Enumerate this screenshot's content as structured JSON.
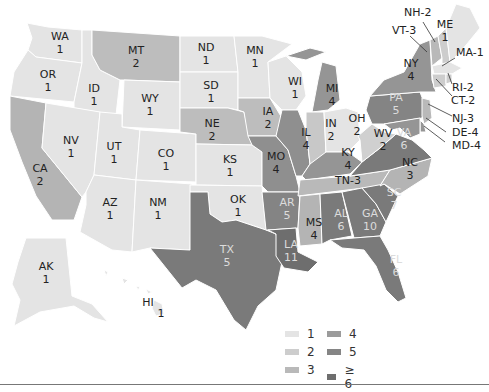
{
  "legend": {
    "items": [
      {
        "label": "1",
        "color": "#e4e4e4"
      },
      {
        "label": "2",
        "color": "#cdcdcd"
      },
      {
        "label": "3",
        "color": "#b9b9b9"
      },
      {
        "label": "4",
        "color": "#9b9b9b"
      },
      {
        "label": "5",
        "color": "#858585"
      },
      {
        "label": "≥ 6",
        "color": "#6e6e6e"
      }
    ]
  },
  "states": [
    {
      "abbr": "WA",
      "value": "1"
    },
    {
      "abbr": "OR",
      "value": "1"
    },
    {
      "abbr": "CA",
      "value": "2"
    },
    {
      "abbr": "ID",
      "value": "1"
    },
    {
      "abbr": "NV",
      "value": "1"
    },
    {
      "abbr": "MT",
      "value": "2"
    },
    {
      "abbr": "WY",
      "value": "1"
    },
    {
      "abbr": "UT",
      "value": "1"
    },
    {
      "abbr": "AZ",
      "value": "1"
    },
    {
      "abbr": "CO",
      "value": "1"
    },
    {
      "abbr": "NM",
      "value": "1"
    },
    {
      "abbr": "ND",
      "value": "1"
    },
    {
      "abbr": "SD",
      "value": "1"
    },
    {
      "abbr": "NE",
      "value": "2"
    },
    {
      "abbr": "KS",
      "value": "1"
    },
    {
      "abbr": "OK",
      "value": "1"
    },
    {
      "abbr": "TX",
      "value": "5"
    },
    {
      "abbr": "MN",
      "value": "1"
    },
    {
      "abbr": "IA",
      "value": "2"
    },
    {
      "abbr": "MO",
      "value": "4"
    },
    {
      "abbr": "AR",
      "value": "5"
    },
    {
      "abbr": "LA",
      "value": "11"
    },
    {
      "abbr": "WI",
      "value": "1"
    },
    {
      "abbr": "IL",
      "value": "4"
    },
    {
      "abbr": "MI",
      "value": "4"
    },
    {
      "abbr": "IN",
      "value": "2"
    },
    {
      "abbr": "OH",
      "value": "2"
    },
    {
      "abbr": "KY",
      "value": "4"
    },
    {
      "abbr": "TN",
      "value": "3"
    },
    {
      "abbr": "MS",
      "value": "4"
    },
    {
      "abbr": "AL",
      "value": "6"
    },
    {
      "abbr": "GA",
      "value": "10"
    },
    {
      "abbr": "FL",
      "value": "6"
    },
    {
      "abbr": "SC",
      "value": "7"
    },
    {
      "abbr": "NC",
      "value": "3"
    },
    {
      "abbr": "VA",
      "value": "6"
    },
    {
      "abbr": "WV",
      "value": "2"
    },
    {
      "abbr": "PA",
      "value": "5"
    },
    {
      "abbr": "NY",
      "value": "4"
    },
    {
      "abbr": "VT",
      "value": "3"
    },
    {
      "abbr": "NH",
      "value": "2"
    },
    {
      "abbr": "ME",
      "value": "1"
    },
    {
      "abbr": "MA",
      "value": "1"
    },
    {
      "abbr": "RI",
      "value": "2"
    },
    {
      "abbr": "CT",
      "value": "2"
    },
    {
      "abbr": "NJ",
      "value": "3"
    },
    {
      "abbr": "DE",
      "value": "4"
    },
    {
      "abbr": "MD",
      "value": "4"
    },
    {
      "abbr": "AK",
      "value": "1"
    },
    {
      "abbr": "HI",
      "value": "1"
    }
  ],
  "labels": {
    "WA": "WA\n1",
    "OR": "OR\n1",
    "CA": "CA\n2",
    "ID": "ID\n1",
    "NV": "NV\n1",
    "MT": "MT\n2",
    "WY": "WY\n1",
    "UT": "UT\n1",
    "AZ": "AZ\n1",
    "CO": "CO\n1",
    "NM": "NM\n1",
    "ND": "ND\n1",
    "SD": "SD\n1",
    "NE": "NE\n2",
    "KS": "KS\n1",
    "OK": "OK\n1",
    "TX": "TX\n5",
    "MN": "MN\n1",
    "IA": "IA\n2",
    "MO": "MO\n4",
    "AR": "AR\n5",
    "LA": "LA\n11",
    "WI": "WI\n1",
    "IL": "IL\n4",
    "MI": "MI\n4",
    "IN": "IN\n2",
    "OH": "OH\n2",
    "KY": "KY\n4",
    "TN": "TN-3",
    "MS": "MS\n4",
    "AL": "AL\n6",
    "GA": "GA\n10",
    "FL": "FL\n6",
    "SC": "SC\n7",
    "NC": "NC\n3",
    "VA": "VA\n6",
    "WV": "WV\n2",
    "PA": "PA\n5",
    "NY": "NY\n4",
    "ME": "ME\n1",
    "AK": "AK\n1",
    "HI": "HI"
  },
  "hi_value": "1",
  "callouts": {
    "NH": "NH-2",
    "VT": "VT-3",
    "MA": "MA-1",
    "RI": "RI-2",
    "CT": "CT-2",
    "NJ": "NJ-3",
    "DE": "DE-4",
    "MD": "MD-4"
  }
}
